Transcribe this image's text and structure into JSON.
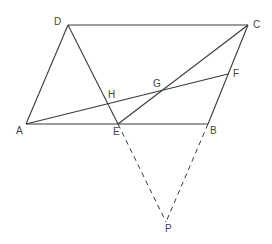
{
  "diagram": {
    "colors": {
      "line": "#3a3a3a",
      "label": "#444444",
      "background": "#ffffff"
    },
    "points": {
      "A": {
        "label": "A",
        "x": 26,
        "y": 124
      },
      "B": {
        "label": "B",
        "x": 208,
        "y": 124
      },
      "C": {
        "label": "C",
        "x": 248,
        "y": 25
      },
      "D": {
        "label": "D",
        "x": 68,
        "y": 25
      },
      "E": {
        "label": "E",
        "x": 118,
        "y": 124
      },
      "F": {
        "label": "F",
        "x": 228,
        "y": 74
      },
      "G": {
        "label": "G",
        "x": 161,
        "y": 89
      },
      "H": {
        "label": "H",
        "x": 109,
        "y": 104
      },
      "P": {
        "label": "P",
        "x": 166,
        "y": 222
      }
    },
    "segments_solid": [
      "AB",
      "BC",
      "CD",
      "DA",
      "DE",
      "CE",
      "AF"
    ],
    "segments_dashed": [
      "EP",
      "BP"
    ]
  }
}
